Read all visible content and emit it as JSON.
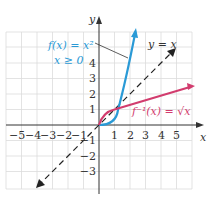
{
  "figure": {
    "axes": {
      "x_label": "x",
      "y_label": "y",
      "x_ticks": [
        "−5",
        "−4",
        "−3",
        "−2",
        "−1",
        "1",
        "2",
        "3",
        "4",
        "5"
      ],
      "y_ticks": [
        "4",
        "3",
        "2",
        "1",
        "−1",
        "−2",
        "−3"
      ]
    },
    "curves": [
      {
        "name": "f",
        "label_line1": "f(x) = x²",
        "label_line2": "x ≥ 0",
        "color": "#2a9ad6"
      },
      {
        "name": "f-inverse",
        "label": "f⁻¹(x) = √x",
        "color": "#d23c6e"
      },
      {
        "name": "identity",
        "label": "y = x",
        "color": "#222222",
        "style": "dashed"
      }
    ],
    "grid_color": "#d8d8d8"
  }
}
